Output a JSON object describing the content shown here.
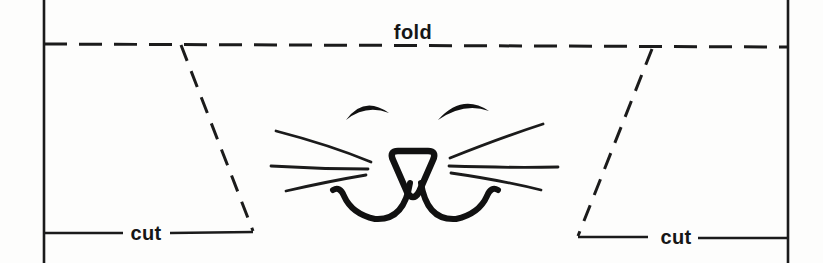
{
  "window": {
    "width": 823,
    "height": 263
  },
  "diagram": {
    "kind": "paper-craft cut-and-fold template with smiling cat face",
    "labels": {
      "fold": "fold",
      "cut_left": "cut",
      "cut_right": "cut"
    },
    "colors": {
      "line": "#1b1b1b",
      "background": "#fdfdfc",
      "text": "#161616"
    }
  }
}
